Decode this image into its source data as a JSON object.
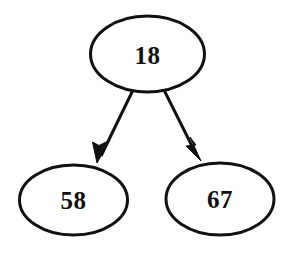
{
  "diagram": {
    "type": "binary-tree",
    "canvas": {
      "width": 291,
      "height": 255,
      "background_color": "#ffffff"
    },
    "style": {
      "node_fill": "#ffffff",
      "node_stroke": "#111111",
      "node_stroke_width": 3,
      "edge_color": "#111111",
      "edge_width": 3,
      "label_color": "#111111"
    },
    "nodes": [
      {
        "id": "root",
        "label": "18",
        "role": "root",
        "cx": 147.5,
        "cy": 54,
        "rx": 57,
        "ry": 38
      },
      {
        "id": "left-child",
        "label": "58",
        "role": "left-child",
        "cx": 73.5,
        "cy": 200,
        "rx": 54,
        "ry": 35
      },
      {
        "id": "right-child",
        "label": "67",
        "role": "right-child",
        "cx": 220,
        "cy": 199,
        "rx": 54,
        "ry": 36
      }
    ],
    "edges": [
      {
        "id": "edge-root-left",
        "from": "root",
        "to": "left-child",
        "label": "",
        "arrowhead": "solid-triangle",
        "x1": 133,
        "y1": 90,
        "x2": 99,
        "y2": 160
      },
      {
        "id": "edge-root-right",
        "from": "root",
        "to": "right-child",
        "label": "",
        "arrowhead": "solid-triangle",
        "x1": 164,
        "y1": 90,
        "x2": 198,
        "y2": 158
      }
    ]
  }
}
